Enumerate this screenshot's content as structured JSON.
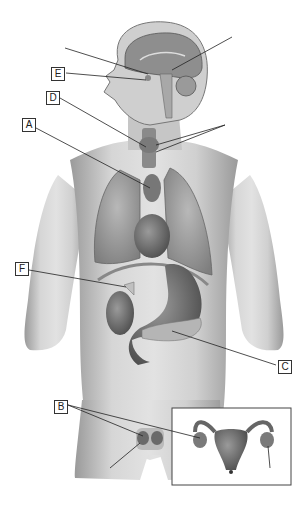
{
  "figure": {
    "labels": [
      {
        "id": "E",
        "text": "E",
        "x": 51,
        "y": 67
      },
      {
        "id": "D",
        "text": "D",
        "x": 46,
        "y": 91
      },
      {
        "id": "A",
        "text": "A",
        "x": 22,
        "y": 118
      },
      {
        "id": "F",
        "text": "F",
        "x": 15,
        "y": 262
      },
      {
        "id": "C",
        "text": "C",
        "x": 278,
        "y": 360
      },
      {
        "id": "B",
        "text": "B",
        "x": 54,
        "y": 400
      }
    ],
    "inset": {
      "subject": "Female reproductive organs (uterus and ovaries)"
    },
    "colors": {
      "background": "#ffffff",
      "skin": "#bdbdbd",
      "organ": "#6e6e6e",
      "line": "#222222",
      "box_border": "#333333"
    }
  }
}
